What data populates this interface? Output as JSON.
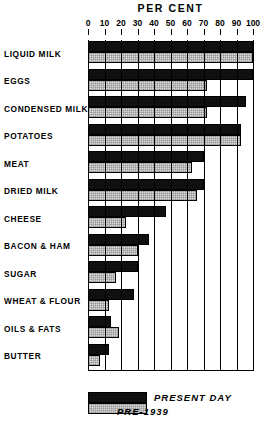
{
  "chart_data": {
    "type": "bar",
    "orientation": "horizontal",
    "title": "PER CENT",
    "xlabel": "PER CENT",
    "ylabel": "",
    "xlim": [
      0,
      100
    ],
    "xticks": [
      0,
      10,
      20,
      30,
      40,
      50,
      60,
      70,
      80,
      90,
      100
    ],
    "grid": true,
    "grid_axis": "x",
    "legend_position": "bottom",
    "categories": [
      "LIQUID MILK",
      "EGGS",
      "CONDENSED MILK",
      "POTATOES",
      "MEAT",
      "DRIED MILK",
      "CHEESE",
      "BACON & HAM",
      "SUGAR",
      "WHEAT & FLOUR",
      "OILS & FATS",
      "BUTTER"
    ],
    "series": [
      {
        "name": "PRESENT DAY",
        "color": "#101010",
        "values": [
          100,
          100,
          96,
          93,
          70,
          70,
          47,
          37,
          30,
          28,
          14,
          13
        ]
      },
      {
        "name": "PRE-1939",
        "color": "#d8d8d8",
        "values": [
          100,
          72,
          72,
          93,
          63,
          66,
          23,
          30,
          17,
          13,
          19,
          7
        ]
      }
    ]
  },
  "legend": {
    "present_label": "PRESENT DAY",
    "pre_label": "PRE-1939"
  }
}
